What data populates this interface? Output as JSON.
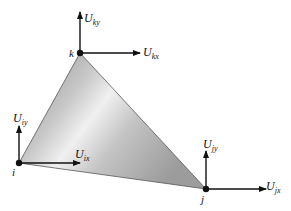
{
  "diagram": {
    "type": "triangular-element-nodal-displacements",
    "colors": {
      "ink": "#111111",
      "fill_light": "#f2f2f2",
      "fill_mid": "#cfcfcf",
      "fill_dark": "#9a9a9a",
      "edge": "#555555"
    },
    "nodes": [
      {
        "id": "i",
        "label": "i",
        "x": 19,
        "y": 163
      },
      {
        "id": "j",
        "label": "j",
        "x": 206,
        "y": 189
      },
      {
        "id": "k",
        "label": "k",
        "x": 80,
        "y": 53
      }
    ],
    "arrows": [
      {
        "node": "k",
        "dir": "y",
        "symbol": "U",
        "subscript": "ky"
      },
      {
        "node": "k",
        "dir": "x",
        "symbol": "U",
        "subscript": "kx"
      },
      {
        "node": "i",
        "dir": "y",
        "symbol": "U",
        "subscript": "iy"
      },
      {
        "node": "i",
        "dir": "x",
        "symbol": "U",
        "subscript": "ix"
      },
      {
        "node": "j",
        "dir": "y",
        "symbol": "U",
        "subscript": "jy"
      },
      {
        "node": "j",
        "dir": "x",
        "symbol": "U",
        "subscript": "jx"
      }
    ],
    "labels": {
      "k": "k",
      "i": "i",
      "j": "j",
      "U": "U",
      "ky": "ky",
      "kx": "kx",
      "iy": "iy",
      "ix": "ix",
      "jy": "jy",
      "jx": "jx"
    }
  }
}
